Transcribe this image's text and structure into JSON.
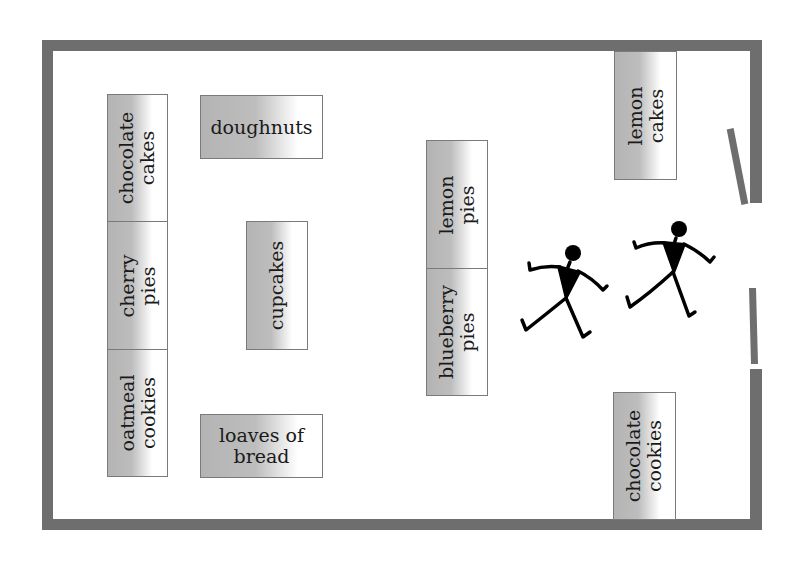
{
  "diagram": {
    "type": "store floor plan",
    "colors": {
      "wall": "#6e6e6e",
      "shelf_shade": "#b4b4b4",
      "shelf_border": "#7a7a7a",
      "figure": "#000000"
    },
    "shelves": [
      {
        "id": "chocolate-cakes",
        "label": "chocolate\ncakes",
        "orientation": "vertical"
      },
      {
        "id": "cherry-pies",
        "label": "cherry\npies",
        "orientation": "vertical"
      },
      {
        "id": "oatmeal-cookies",
        "label": "oatmeal\ncookies",
        "orientation": "vertical"
      },
      {
        "id": "doughnuts",
        "label": "doughnuts",
        "orientation": "horizontal"
      },
      {
        "id": "cupcakes",
        "label": "cupcakes",
        "orientation": "vertical"
      },
      {
        "id": "loaves-of-bread",
        "label": "loaves of\nbread",
        "orientation": "horizontal"
      },
      {
        "id": "lemon-pies",
        "label": "lemon\npies",
        "orientation": "vertical"
      },
      {
        "id": "blueberry-pies",
        "label": "blueberry\npies",
        "orientation": "vertical"
      },
      {
        "id": "lemon-cakes",
        "label": "lemon\ncakes",
        "orientation": "vertical"
      },
      {
        "id": "chocolate-cookies",
        "label": "chocolate\ncookies",
        "orientation": "vertical"
      }
    ],
    "figures": [
      {
        "id": "person-1",
        "icon": "walking-person-icon"
      },
      {
        "id": "person-2",
        "icon": "walking-person-icon"
      }
    ],
    "entrance": {
      "icon": "double-door-icon",
      "state": "open"
    }
  }
}
